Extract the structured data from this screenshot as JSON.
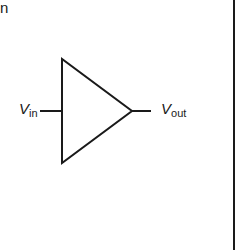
{
  "page_fragment": {
    "text": "n"
  },
  "diagram": {
    "input_label": {
      "var": "V",
      "sub": "in"
    },
    "output_label": {
      "var": "V",
      "sub": "out"
    },
    "stroke_color": "#1a1a1a",
    "border_line": {
      "x": 234
    }
  }
}
